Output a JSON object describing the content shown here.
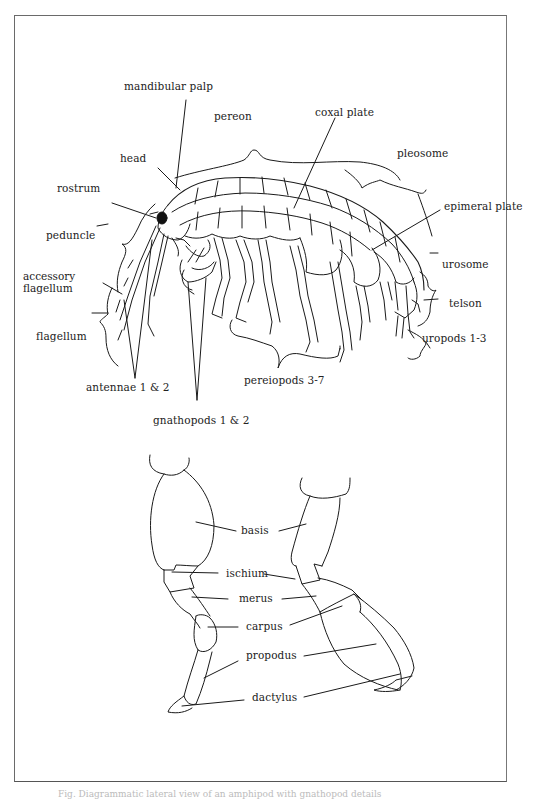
{
  "figure": {
    "body_labels": {
      "mandibular_palp": "mandibular palp",
      "pereon": "pereon",
      "coxal_plate": "coxal plate",
      "pleosome": "pleosome",
      "head": "head",
      "rostrum": "rostrum",
      "epimeral_plate": "epimeral plate",
      "peduncle": "peduncle",
      "accessory_flagellum": "accessory flagellum",
      "urosome": "urosome",
      "telson": "telson",
      "flagellum": "flagellum",
      "uropods": "uropods 1-3",
      "antennae": "antennae 1 & 2",
      "pereiopods": "pereiopods 3-7",
      "gnathopods": "gnathopods 1 & 2"
    },
    "leg_labels": {
      "basis": "basis",
      "ischium": "ischium",
      "merus": "merus",
      "carpus": "carpus",
      "propodus": "propodus",
      "dactylus": "dactylus"
    },
    "caption": "Fig. Diagrammatic lateral view of an amphipod with gnathopod details"
  }
}
